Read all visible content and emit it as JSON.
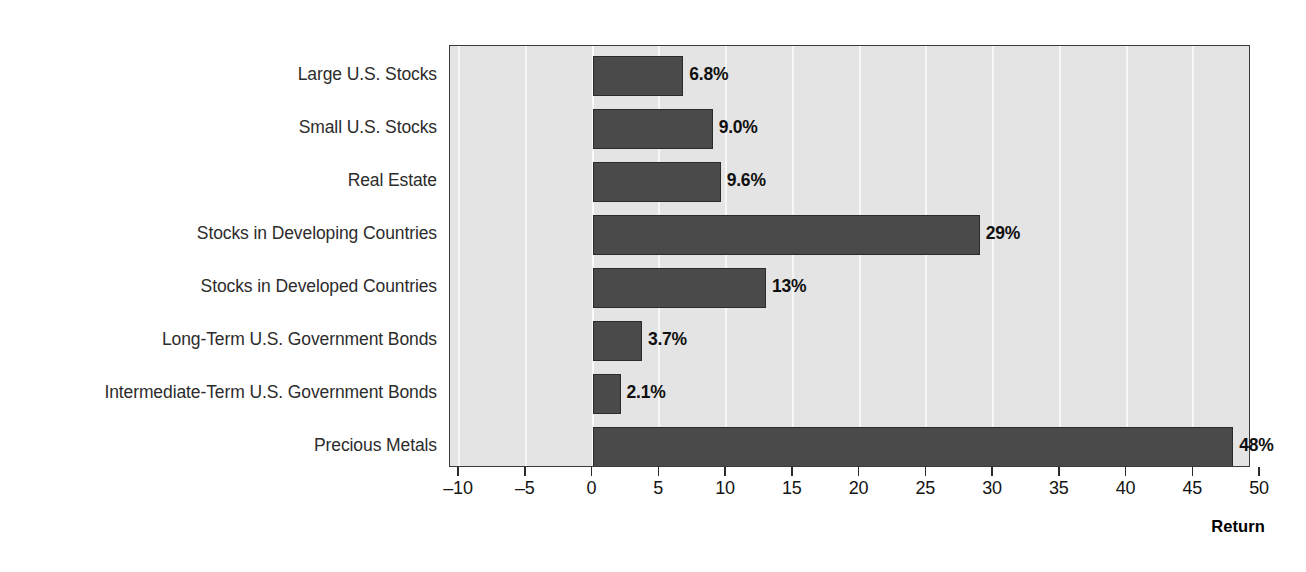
{
  "chart_data": {
    "type": "bar",
    "orientation": "horizontal",
    "title": "",
    "xlabel": "Return",
    "ylabel": "",
    "xlim": [
      -10,
      50
    ],
    "xticks": [
      -10,
      -5,
      0,
      5,
      10,
      15,
      20,
      25,
      30,
      35,
      40,
      45,
      50
    ],
    "xtick_labels": [
      "–10",
      "–5",
      "0",
      "5",
      "10",
      "15",
      "20",
      "25",
      "30",
      "35",
      "40",
      "45",
      "50"
    ],
    "grid": true,
    "grid_axis": "x",
    "legend": "none",
    "categories": [
      "Large U.S. Stocks",
      "Small U.S. Stocks",
      "Real Estate",
      "Stocks in Developing Countries",
      "Stocks in Developed Countries",
      "Long-Term U.S. Government Bonds",
      "Intermediate-Term U.S. Government Bonds",
      "Precious Metals"
    ],
    "values": [
      6.8,
      9.0,
      9.6,
      29,
      13,
      3.7,
      2.1,
      48
    ],
    "value_labels": [
      "6.8%",
      "9.0%",
      "9.6%",
      "29%",
      "13%",
      "3.7%",
      "2.1%",
      "48%"
    ],
    "colors": {
      "bar_fill": "#4a4a4a",
      "bar_border": "#2b2b2b",
      "plot_background": "#e4e4e4",
      "gridline": "#f7f7f7",
      "axis": "#2b2b2b",
      "text": "#1a1a1a",
      "page_background": "#ffffff"
    }
  }
}
